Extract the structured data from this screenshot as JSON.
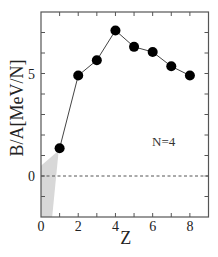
{
  "chart_data": {
    "type": "line",
    "title": "",
    "xlabel": "Z",
    "ylabel": "B/A[MeV/N]",
    "xlim": [
      0,
      9
    ],
    "ylim": [
      -2,
      8
    ],
    "x_ticks_major": [
      0,
      2,
      4,
      6,
      8
    ],
    "x_ticks_minor": [
      1,
      3,
      5,
      7,
      9
    ],
    "y_ticks_major": [
      0,
      5
    ],
    "y_ticks_minor": [
      -2,
      -1,
      1,
      2,
      3,
      4,
      6,
      7,
      8
    ],
    "grid": false,
    "legend": null,
    "series": [
      {
        "name": "N=4",
        "marker": "filled-circle",
        "color": "#000000",
        "line_color": "#444444",
        "x": [
          1,
          2,
          3,
          4,
          5,
          6,
          7,
          8
        ],
        "y": [
          1.35,
          4.9,
          5.65,
          7.1,
          6.3,
          6.05,
          5.35,
          4.9
        ]
      }
    ],
    "reference_lines": [
      {
        "type": "horizontal",
        "y": 0,
        "style": "dashed",
        "color": "#555555"
      }
    ],
    "shaded_regions": [
      {
        "description": "grey shaded unbound region near Z=0",
        "color": "#d8d8d8",
        "polygon": [
          [
            0,
            0.5
          ],
          [
            0.95,
            1.25
          ],
          [
            0.6,
            -2
          ],
          [
            0,
            -2
          ]
        ]
      }
    ],
    "annotations": [
      {
        "text": "N=4",
        "x": 6.0,
        "y": 1.7
      }
    ]
  }
}
